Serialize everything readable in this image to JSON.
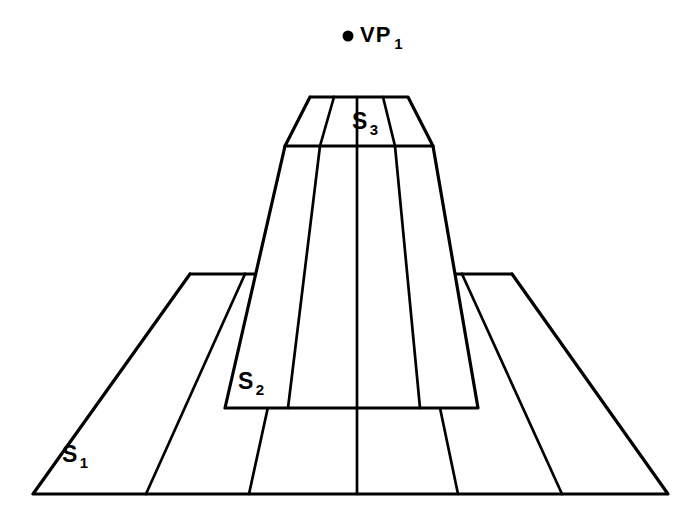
{
  "figure": {
    "type": "one-point-perspective-diagram",
    "title": "",
    "background_color": "#ffffff",
    "line_color": "#000000",
    "labels": {
      "vanishing_point": {
        "base": "VP",
        "subscript": "1",
        "x": 360,
        "y": 24
      },
      "tier_top": {
        "base": "S",
        "subscript": "3",
        "x": 352,
        "y": 110
      },
      "tier_middle": {
        "base": "S",
        "subscript": "2",
        "x": 238,
        "y": 370
      },
      "tier_base": {
        "base": "S",
        "subscript": "1",
        "x": 62,
        "y": 443
      }
    },
    "vanishing_point": {
      "cx": 348,
      "cy": 36,
      "r": 5.5
    },
    "icons": {
      "vanishing_point_dot": "filled-circle-icon"
    },
    "geometry": {
      "tier_base": {
        "name": "S1",
        "top_y": 274,
        "bottom_y": 494,
        "top_left_x": 190,
        "top_right_x": 512,
        "bottom_left_x": 33,
        "bottom_right_x": 668,
        "top_dividers": [
          190,
          245,
          297,
          357,
          412,
          462,
          512
        ],
        "bottom_dividers": [
          33,
          146,
          249,
          357,
          458,
          562,
          668
        ]
      },
      "tier_middle": {
        "name": "S2",
        "top_y": 146,
        "bottom_y": 408,
        "top_left_x": 285,
        "top_right_x": 433,
        "bottom_left_x": 225,
        "bottom_right_x": 478,
        "top_dividers": [
          285,
          320,
          357,
          395,
          433
        ],
        "bottom_dividers": [
          225,
          288,
          357,
          420,
          478
        ]
      },
      "tier_top": {
        "name": "S3",
        "top_y": 97,
        "bottom_y": 146,
        "top_left_x": 310,
        "top_right_x": 408,
        "bottom_left_x": 285,
        "bottom_right_x": 433,
        "top_dividers": [
          310,
          334,
          357,
          383,
          408
        ],
        "bottom_dividers": [
          285,
          320,
          357,
          395,
          433
        ]
      }
    }
  }
}
